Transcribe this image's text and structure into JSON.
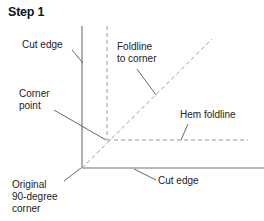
{
  "figure": {
    "title": "Step 1",
    "background_color": "#ffffff",
    "line_color": "#6e6e6e",
    "dash_color": "#9a9a9a",
    "leader_color": "#555555",
    "text_color": "#222222"
  },
  "labels": {
    "cut_edge_top": "Cut edge",
    "foldline_to_corner_line1": "Foldline",
    "foldline_to_corner_line2": "to corner",
    "corner_point_line1": "Corner",
    "corner_point_line2": "point",
    "hem_foldline": "Hem foldline",
    "cut_edge_bottom": "Cut edge",
    "original_corner_line1": "Original",
    "original_corner_line2": "90-degree",
    "original_corner_line3": "corner"
  },
  "geometry": {
    "corner_point_90": {
      "x": 82,
      "y": 168
    },
    "corner_point_hem": {
      "x": 107,
      "y": 140
    },
    "vertical_cut_edge": {
      "x": 82,
      "y1": 26,
      "y2": 168
    },
    "horizontal_cut_edge": {
      "y": 168,
      "x1": 82,
      "x2": 264
    },
    "vertical_foldline_dashed": {
      "x": 107,
      "y1": 26,
      "y2": 140
    },
    "horizontal_hem_foldline_dashed": {
      "y": 140,
      "x1": 107,
      "x2": 248
    },
    "diagonal_foldline_dashed": {
      "x1": 82,
      "y1": 168,
      "x2": 212,
      "y2": 39
    },
    "leaders": [
      {
        "name": "cut-edge-top-leader",
        "x1": 72,
        "y1": 50,
        "x2": 83,
        "y2": 63
      },
      {
        "name": "foldline-to-corner-leader",
        "x1": 137,
        "y1": 69,
        "x2": 156,
        "y2": 95
      },
      {
        "name": "corner-point-leader",
        "x1": 54,
        "y1": 110,
        "x2": 106,
        "y2": 140
      },
      {
        "name": "hem-foldline-leader",
        "x1": 188,
        "y1": 124,
        "x2": 181,
        "y2": 140
      },
      {
        "name": "cut-edge-bottom-leader",
        "x1": 156,
        "y1": 180,
        "x2": 134,
        "y2": 169
      },
      {
        "name": "original-corner-leader",
        "x1": 64,
        "y1": 181,
        "x2": 81,
        "y2": 168
      }
    ]
  }
}
